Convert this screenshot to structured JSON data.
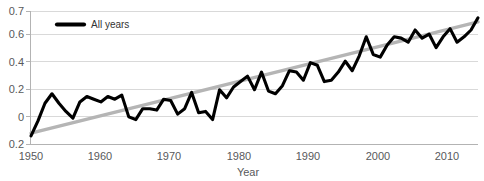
{
  "chart_data": {
    "type": "line",
    "title": "",
    "xlabel": "Year",
    "ylabel": "",
    "grid": "horizontal",
    "legend_position": "top-left-inside",
    "xlim": [
      1950,
      2014
    ],
    "ylim": [
      -0.28,
      0.7
    ],
    "xticks": [
      1950,
      1960,
      1970,
      1980,
      1990,
      2000,
      2010
    ],
    "xtick_labels": [
      "1950",
      "1960",
      "1970",
      "1980",
      "1990",
      "2000",
      "2010"
    ],
    "yticks": [
      0.7,
      0.6,
      0.4,
      0.2,
      0,
      -0.2
    ],
    "ytick_labels": [
      "0.7",
      "0.6",
      "0.4",
      "0.2",
      "0",
      "0.2"
    ],
    "legend": [
      {
        "name": "All years",
        "color": "#000000",
        "style": "thick-solid-line"
      }
    ],
    "series": [
      {
        "name": "All years",
        "color": "#000000",
        "x": [
          1950,
          1951,
          1952,
          1953,
          1954,
          1955,
          1956,
          1957,
          1958,
          1959,
          1960,
          1961,
          1962,
          1963,
          1964,
          1965,
          1966,
          1967,
          1968,
          1969,
          1970,
          1971,
          1972,
          1973,
          1974,
          1975,
          1976,
          1977,
          1978,
          1979,
          1980,
          1981,
          1982,
          1983,
          1984,
          1985,
          1986,
          1987,
          1988,
          1989,
          1990,
          1991,
          1992,
          1993,
          1994,
          1995,
          1996,
          1997,
          1998,
          1999,
          2000,
          2001,
          2002,
          2003,
          2004,
          2005,
          2006,
          2007,
          2008,
          2009,
          2010,
          2011,
          2012,
          2013,
          2014
        ],
        "y": [
          -0.22,
          -0.11,
          0.02,
          0.09,
          0.02,
          -0.04,
          -0.09,
          0.03,
          0.07,
          0.05,
          0.03,
          0.07,
          0.05,
          0.08,
          -0.08,
          -0.1,
          -0.02,
          -0.02,
          -0.03,
          0.05,
          0.04,
          -0.06,
          -0.02,
          0.1,
          -0.05,
          -0.04,
          -0.1,
          0.12,
          0.06,
          0.14,
          0.18,
          0.22,
          0.12,
          0.25,
          0.11,
          0.09,
          0.15,
          0.26,
          0.25,
          0.19,
          0.32,
          0.3,
          0.18,
          0.19,
          0.25,
          0.33,
          0.26,
          0.37,
          0.51,
          0.38,
          0.36,
          0.45,
          0.51,
          0.5,
          0.47,
          0.56,
          0.5,
          0.53,
          0.43,
          0.51,
          0.57,
          0.47,
          0.51,
          0.56,
          0.65
        ],
        "linewidth": 3.1
      },
      {
        "name": "linear-trend",
        "color": "#b5b5b5",
        "x": [
          1950,
          2014
        ],
        "y": [
          -0.2,
          0.62
        ],
        "linewidth": 3.4
      }
    ]
  }
}
